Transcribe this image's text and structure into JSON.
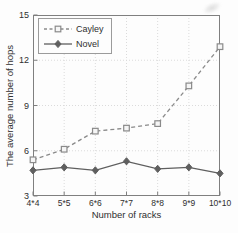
{
  "chart_data": {
    "type": "line",
    "categories": [
      "4*4",
      "5*5",
      "6*6",
      "7*7",
      "8*8",
      "9*9",
      "10*10"
    ],
    "series": [
      {
        "name": "Cayley",
        "values": [
          5.4,
          6.1,
          7.3,
          7.5,
          7.8,
          10.3,
          12.9
        ],
        "style": "dashed",
        "marker": "square",
        "color": "#8a8a8a"
      },
      {
        "name": "Novel",
        "values": [
          4.7,
          4.9,
          4.7,
          5.3,
          4.8,
          4.9,
          4.5
        ],
        "style": "solid",
        "marker": "diamond",
        "color": "#5f5f5f"
      }
    ],
    "title": "",
    "xlabel": "Number of racks",
    "ylabel": "The average number of hops",
    "ylim": [
      3,
      15
    ],
    "yticks": [
      3,
      6,
      9,
      12,
      15
    ],
    "grid": true,
    "legend_position": "top-left"
  },
  "colors": {
    "axis": "#7f7f7f",
    "grid": "#dbdbdb",
    "text": "#2f2f2f",
    "background": "#fdfdfd",
    "marker_fill": "#f5f5f5",
    "cayley": "#8a8a8a",
    "novel": "#5f5f5f"
  }
}
